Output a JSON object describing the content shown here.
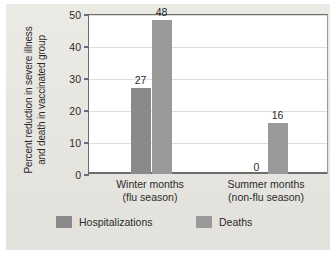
{
  "chart_data": {
    "type": "bar",
    "title": "",
    "xlabel": "",
    "ylabel_line1": "Percent reduction in severe illness",
    "ylabel_line2": "and death in vaccinated group",
    "ylim": [
      0,
      50
    ],
    "yticks": [
      0,
      10,
      20,
      30,
      40,
      50
    ],
    "ytick_labels": [
      "0",
      "10",
      "20",
      "30",
      "40",
      "50"
    ],
    "grid": true,
    "legend_position": "bottom",
    "categories": [
      "Winter months (flu season)",
      "Summer months (non-flu season)"
    ],
    "category_lines": [
      {
        "line1": "Winter months",
        "line2": "(flu season)"
      },
      {
        "line1": "Summer months",
        "line2": "(non-flu season)"
      }
    ],
    "series": [
      {
        "name": "Hospitalizations",
        "color": "#8a8a8a",
        "values": [
          27,
          0
        ],
        "value_labels": [
          "27",
          "0"
        ]
      },
      {
        "name": "Deaths",
        "color": "#9a9a9a",
        "values": [
          48,
          16
        ],
        "value_labels": [
          "48",
          "16"
        ]
      }
    ]
  },
  "legend": {
    "items": [
      {
        "label": "Hospitalizations",
        "color": "#8a8a8a"
      },
      {
        "label": "Deaths",
        "color": "#9a9a9a"
      }
    ]
  },
  "colors": {
    "paper": "#e9e7e2",
    "plot_background": "#ffffff",
    "axis": "#6d6d6d",
    "gridline": "#dedede",
    "text": "#2b2b2b"
  }
}
